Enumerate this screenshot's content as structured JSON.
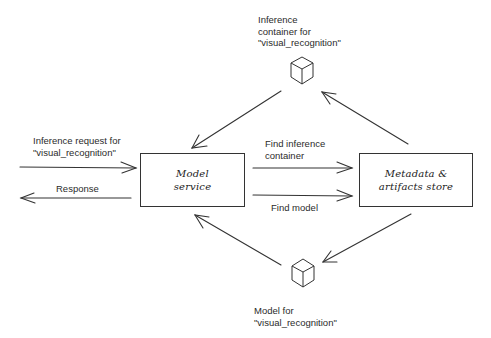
{
  "diagram": {
    "nodes": {
      "model_service": {
        "label_line1": "Model",
        "label_line2": "service"
      },
      "metadata_store": {
        "label_line1": "Metadata &",
        "label_line2": "artifacts store"
      },
      "inference_container": {
        "label_line1": "Inference",
        "label_line2": "container for",
        "label_line3": "\"visual_recognition\""
      },
      "model": {
        "label_line1": "Model for",
        "label_line2": "\"visual_recognition\""
      }
    },
    "edges": {
      "request": {
        "label_line1": "Inference request for",
        "label_line2": "\"visual_recognition\""
      },
      "response": {
        "label": "Response"
      },
      "find_container": {
        "label_line1": "Find inference",
        "label_line2": "container"
      },
      "find_model": {
        "label": "Find model"
      }
    }
  }
}
